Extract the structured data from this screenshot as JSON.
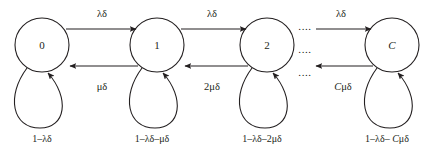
{
  "diagram": {
    "type": "markov-chain-state-transition-diagram",
    "title": "",
    "stroke_color": "#231f20",
    "background_color": "#ffffff",
    "nodes": [
      {
        "id": "s0",
        "label": "0",
        "italic": false,
        "cx": 42,
        "cy": 45,
        "r": 27
      },
      {
        "id": "s1",
        "label": "1",
        "italic": false,
        "cx": 157,
        "cy": 45,
        "r": 27
      },
      {
        "id": "s2",
        "label": "2",
        "italic": false,
        "cx": 267,
        "cy": 45,
        "r": 27
      },
      {
        "id": "sC",
        "label": "C",
        "italic": true,
        "cx": 392,
        "cy": 45,
        "r": 27
      }
    ],
    "forward_labels": [
      {
        "id": "f0",
        "text": "λδ",
        "x": 102,
        "y": 17
      },
      {
        "id": "f1",
        "text": "λδ",
        "x": 212,
        "y": 17
      },
      {
        "id": "f2",
        "text": "λδ",
        "x": 341,
        "y": 17
      }
    ],
    "backward_labels": [
      {
        "id": "b0",
        "text": "μδ",
        "x": 102,
        "y": 90
      },
      {
        "id": "b1",
        "text": "2μδ",
        "x": 212,
        "y": 90
      },
      {
        "id": "b2",
        "prefix": "C",
        "suffix": "μδ",
        "x": 343,
        "y": 90
      }
    ],
    "self_loop_labels": [
      {
        "id": "l0",
        "text": "1–λδ",
        "x": 42,
        "y": 142
      },
      {
        "id": "l1",
        "text": "1–λδ–μδ",
        "x": 152,
        "y": 142
      },
      {
        "id": "l2",
        "text": "1–λδ–2μδ",
        "x": 262,
        "y": 142
      },
      {
        "id": "lC",
        "prefix": "1–λδ– ",
        "italic_part": "C",
        "suffix": "μδ",
        "x": 387,
        "y": 142
      }
    ],
    "ellipses": [
      {
        "id": "d-top",
        "text": "....",
        "x": 305,
        "y": 27
      },
      {
        "id": "d-middle",
        "text": "....",
        "x": 305,
        "y": 50
      },
      {
        "id": "d-bottom",
        "text": "....",
        "x": 305,
        "y": 73
      }
    ]
  }
}
